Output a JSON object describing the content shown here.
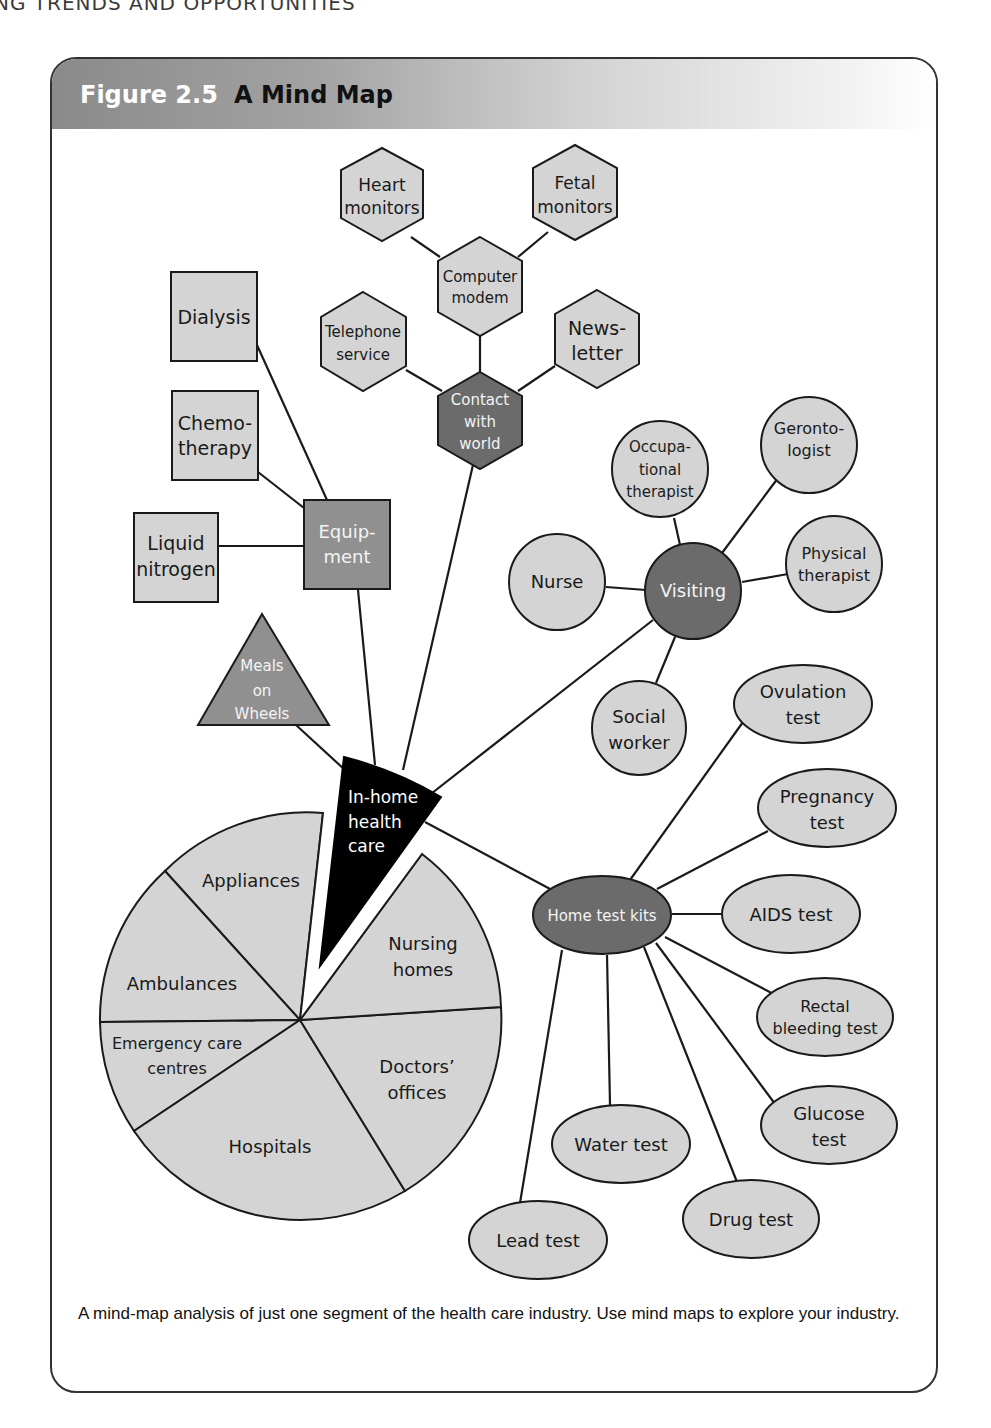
{
  "page": {
    "running_header": "NG TRENDS AND OPPORTUNITIES"
  },
  "figure": {
    "number": "Figure 2.5",
    "title": "A Mind Map",
    "caption": "A mind-map analysis of just one segment of the health care industry. Use mind maps to explore your industry."
  },
  "colors": {
    "light_fill": "#d4d4d4",
    "dark_fill": "#6b6b6b",
    "center_fill": "#000000",
    "stroke": "#1a1a1a",
    "dark_text": "#f4f4f4",
    "light_text": "#1a1a1a"
  },
  "center": {
    "label_lines": [
      "In-home",
      "health",
      "care"
    ]
  },
  "contact_branch": {
    "hub": [
      "Contact",
      "with",
      "world"
    ],
    "computer_modem": [
      "Computer",
      "modem"
    ],
    "heart_monitors": [
      "Heart",
      "monitors"
    ],
    "fetal_monitors": [
      "Fetal",
      "monitors"
    ],
    "telephone_service": [
      "Telephone",
      "service"
    ],
    "newsletter": [
      "News-",
      "letter"
    ]
  },
  "equipment_branch": {
    "hub": [
      "Equip-",
      "ment"
    ],
    "dialysis": [
      "Dialysis"
    ],
    "chemotherapy": [
      "Chemo-",
      "therapy"
    ],
    "liquid_nitrogen": [
      "Liquid",
      "nitrogen"
    ]
  },
  "meals_on_wheels": [
    "Meals",
    "on",
    "Wheels"
  ],
  "visiting_branch": {
    "hub": [
      "Visiting"
    ],
    "occupational_therapist": [
      "Occupa-",
      "tional",
      "therapist"
    ],
    "gerontologist": [
      "Geronto-",
      "logist"
    ],
    "nurse": [
      "Nurse"
    ],
    "physical_therapist": [
      "Physical",
      "therapist"
    ],
    "social_worker": [
      "Social",
      "worker"
    ]
  },
  "test_kits_branch": {
    "hub": [
      "Home test kits"
    ],
    "ovulation": [
      "Ovulation",
      "test"
    ],
    "pregnancy": [
      "Pregnancy",
      "test"
    ],
    "aids": [
      "AIDS test"
    ],
    "rectal_bleeding": [
      "Rectal",
      "bleeding test"
    ],
    "glucose": [
      "Glucose",
      "test"
    ],
    "drug": [
      "Drug test"
    ],
    "water": [
      "Water test"
    ],
    "lead": [
      "Lead test"
    ]
  },
  "pie": {
    "appliances": [
      "Appliances"
    ],
    "ambulances": [
      "Ambulances"
    ],
    "emergency": [
      "Emergency care",
      "centres"
    ],
    "hospitals": [
      "Hospitals"
    ],
    "doctors": [
      "Doctors’",
      "offices"
    ],
    "nursing": [
      "Nursing",
      "homes"
    ]
  }
}
